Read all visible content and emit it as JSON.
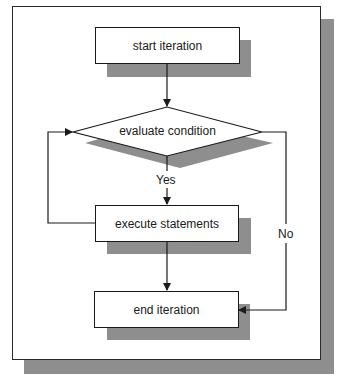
{
  "diagram": {
    "type": "flowchart",
    "title": "",
    "nodes": [
      {
        "id": "start",
        "shape": "rectangle",
        "label": "start iteration"
      },
      {
        "id": "condition",
        "shape": "diamond",
        "label": "evaluate condition"
      },
      {
        "id": "execute",
        "shape": "rectangle",
        "label": "execute statements"
      },
      {
        "id": "end",
        "shape": "rectangle",
        "label": "end iteration"
      }
    ],
    "edges": [
      {
        "from": "start",
        "to": "condition",
        "label": ""
      },
      {
        "from": "condition",
        "to": "execute",
        "label": "Yes"
      },
      {
        "from": "execute",
        "to": "condition",
        "label": ""
      },
      {
        "from": "execute",
        "to": "end",
        "label": ""
      },
      {
        "from": "condition",
        "to": "end",
        "label": "No"
      }
    ],
    "edge_labels": {
      "yes": "Yes",
      "no": "No"
    },
    "colors": {
      "shadow": "#8e8e8e",
      "stroke": "#1a1a1a",
      "fill": "#ffffff"
    }
  }
}
